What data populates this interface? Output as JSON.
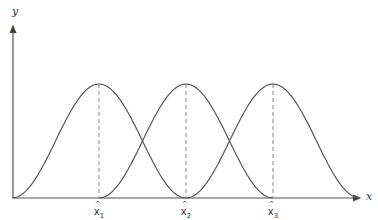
{
  "diagram": {
    "type": "overlapping-membership-curves",
    "axes": {
      "x_label": "x",
      "y_label": "y"
    },
    "centers": [
      {
        "label": "x",
        "subscript": "1",
        "px": 99
      },
      {
        "label": "x",
        "subscript": "2",
        "px": 186
      },
      {
        "label": "x",
        "subscript": "3",
        "px": 273
      }
    ],
    "curve_half_width_px": 87,
    "peak_y_px": 84,
    "baseline_y_px": 198,
    "origin_x_px": 13,
    "colors": {
      "line": "#555555",
      "axis": "#555555",
      "dash": "#888888"
    }
  }
}
